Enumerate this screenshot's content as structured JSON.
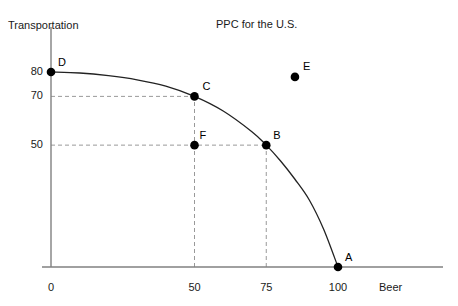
{
  "chart_data": {
    "type": "line",
    "title": "PPC for the U.S.",
    "xlabel": "Beer",
    "ylabel": "Transportation",
    "xlim": [
      0,
      118
    ],
    "ylim": [
      0,
      95
    ],
    "grid": false,
    "legend": "none",
    "xticks": [
      {
        "value": 0,
        "label": "0"
      },
      {
        "value": 50,
        "label": "50"
      },
      {
        "value": 75,
        "label": "75"
      },
      {
        "value": 100,
        "label": "100"
      }
    ],
    "yticks": [
      {
        "value": 50,
        "label": "50"
      },
      {
        "value": 70,
        "label": "70"
      },
      {
        "value": 80,
        "label": "80"
      }
    ],
    "series": [
      {
        "name": "Production Possibilities Curve",
        "type": "line",
        "x": [
          0,
          10,
          20,
          30,
          40,
          50,
          60,
          70,
          75,
          80,
          85,
          90,
          95,
          100
        ],
        "y": [
          80,
          79.6,
          78.5,
          76.8,
          74.2,
          70,
          64,
          55.5,
          50,
          43.5,
          36,
          27.5,
          15.5,
          0
        ]
      }
    ],
    "points": [
      {
        "label": "D",
        "x": 0,
        "y": 80,
        "on_curve": true
      },
      {
        "label": "C",
        "x": 50,
        "y": 70,
        "on_curve": true
      },
      {
        "label": "F",
        "x": 50,
        "y": 50,
        "on_curve": false
      },
      {
        "label": "B",
        "x": 75,
        "y": 50,
        "on_curve": true
      },
      {
        "label": "E",
        "x": 85,
        "y": 78,
        "on_curve": false
      },
      {
        "label": "A",
        "x": 100,
        "y": 0,
        "on_curve": true
      }
    ],
    "guides": [
      {
        "orientation": "horizontal",
        "value": 70,
        "from": 0,
        "to": 50
      },
      {
        "orientation": "horizontal",
        "value": 50,
        "from": 0,
        "to": 75
      },
      {
        "orientation": "vertical",
        "value": 50,
        "from": 0,
        "to": 70
      },
      {
        "orientation": "vertical",
        "value": 75,
        "from": 0,
        "to": 50
      }
    ],
    "colors": {
      "curve": "#222222",
      "axis": "#808080",
      "guide": "#999999",
      "point": "#000000",
      "text": "#1a1a1a"
    }
  }
}
